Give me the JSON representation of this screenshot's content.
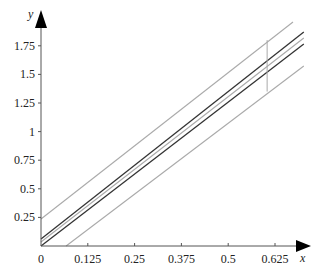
{
  "chart_data": {
    "type": "line",
    "title": "",
    "xlabel": "x",
    "ylabel": "y",
    "xlim": [
      0,
      0.7
    ],
    "ylim": [
      0,
      1.9
    ],
    "grid": false,
    "legend": null,
    "x_ticks": [
      "0",
      "0.125",
      "0.25",
      "0.375",
      "0.5",
      "0.625"
    ],
    "y_ticks": [
      "0.25",
      "0.5",
      "0.75",
      "1",
      "1.25",
      "1.5",
      "1.75"
    ],
    "series": [
      {
        "name": "upper-band",
        "color": "#aaaaaa",
        "x": [
          0,
          0.673
        ],
        "y": [
          0.236,
          1.958
        ]
      },
      {
        "name": "upper-fit",
        "color": "#333333",
        "x": [
          0,
          0.702
        ],
        "y": [
          0.061,
          1.87
        ]
      },
      {
        "name": "center",
        "color": "#aaaaaa",
        "x": [
          0,
          0.702
        ],
        "y": [
          0.035,
          1.818
        ]
      },
      {
        "name": "lower-fit",
        "color": "#333333",
        "x": [
          0,
          0.702
        ],
        "y": [
          0.0,
          1.766
        ]
      },
      {
        "name": "lower-band",
        "color": "#aaaaaa",
        "x": [
          0.067,
          0.702
        ],
        "y": [
          0.0,
          1.573
        ]
      }
    ],
    "annotations": [
      {
        "type": "vline",
        "x": 0.604,
        "y_from": 1.35,
        "y_to": 1.8,
        "color": "#aaaaaa"
      }
    ]
  },
  "layout": {
    "origin_px": [
      41,
      246
    ],
    "px_per_unit_x": 374.4,
    "px_per_unit_y": 114.4
  }
}
